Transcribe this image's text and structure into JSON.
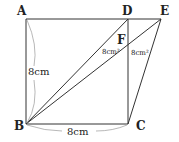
{
  "diagram": {
    "points": {
      "A": {
        "label": "A",
        "x": 26,
        "y": 19
      },
      "D": {
        "label": "D",
        "x": 128,
        "y": 19
      },
      "E": {
        "label": "E",
        "x": 161,
        "y": 19
      },
      "B": {
        "label": "B",
        "x": 26,
        "y": 124
      },
      "C": {
        "label": "C",
        "x": 128,
        "y": 124
      },
      "F": {
        "label": "F",
        "x": 128,
        "y": 44
      }
    },
    "labels": {
      "side_ab": "8cm",
      "side_bc": "8cm",
      "area_left": "8cm²",
      "area_right": "8cm²"
    },
    "line_color": "#333333"
  }
}
